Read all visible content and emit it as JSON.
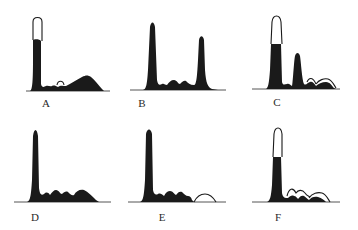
{
  "figure": {
    "panels": [
      {
        "id": "A",
        "label": "A",
        "label_pos": [
          46,
          97
        ],
        "baseline": {
          "x1": 26,
          "x2": 110,
          "y": 91
        },
        "fill": "M30,91 C32,90 33,85 33,60 L33,40 C34,39 40,39 41,41 L41,84 C42,88 44,87 46,86 C48,85 50,87 52,86 C54,85 56,86 58,87 C60,85 64,86 66,86 C70,84 76,80 82,77 C86,75 88,75 91,77 C95,80 99,86 102,89 L104,91 Z",
        "outlines": [
          "M33,40 L33,22 C33,16 42,16 42,22 L42,41",
          "M57,85 C58,80 63,80 64,85"
        ]
      },
      {
        "id": "B",
        "label": "B",
        "label_pos": [
          142,
          97
        ],
        "baseline": {
          "x1": 130,
          "x2": 226,
          "y": 90
        },
        "fill": "M143,90 C146,89 147,86 148,70 L150,27 C151,21 154,21 155,27 L157,80 C158,86 160,85 162,84 C164,83 165,85 167,85 C169,82 171,80 174,80 C177,80 178,84 180,84 C182,82 184,80 186,81 C188,83 190,85 194,85 C196,85 197,80 198,60 L199,40 C200,35 203,35 204,40 L205,70 C206,84 208,87 212,89 L218,90 Z",
        "outlines": []
      },
      {
        "id": "C",
        "label": "C",
        "label_pos": [
          277,
          96
        ],
        "baseline": {
          "x1": 252,
          "x2": 340,
          "y": 89
        },
        "fill": "M266,89 C268,88 269,84 270,70 L271,44 L281,44 L282,82 C283,86 285,84 287,84 C289,83 290,85 292,86 C293,80 294,60 295,56 C296,52 299,52 300,56 C301,62 302,80 304,84 C306,86 308,82 310,82 C312,81 314,83 316,86 C318,84 322,82 326,82 C330,82 332,86 334,88 L336,89 Z",
        "outlines": [
          "M271,44 L272,22 C273,14 280,14 281,22 L282,44",
          "M307,82 C309,77 313,77 316,84",
          "M316,84 C319,80 324,78 328,79 C332,80 334,85 336,88"
        ]
      },
      {
        "id": "D",
        "label": "D",
        "label_pos": [
          35,
          211
        ],
        "baseline": {
          "x1": 14,
          "x2": 111,
          "y": 202
        },
        "fill": "M27,202 C30,201 31,197 32,180 L33,136 C34,128 37,128 38,136 L39,188 C40,196 42,195 44,194 C46,192 48,192 50,195 C52,192 54,190 56,190 C59,190 60,194 62,194 C64,192 66,191 68,192 C70,194 72,196 74,195 C76,191 80,189 84,190 C88,192 92,196 96,200 L99,202 Z",
        "outlines": []
      },
      {
        "id": "E",
        "label": "E",
        "label_pos": [
          162,
          211
        ],
        "baseline": {
          "x1": 128,
          "x2": 226,
          "y": 202
        },
        "fill": "M140,202 C143,201 144,197 145,180 L146,134 C147,128 151,128 152,134 L153,190 C154,195 156,195 158,194 C160,193 162,194 164,196 C166,192 168,191 170,191 C173,191 174,194 176,195 C178,192 180,191 182,192 C184,194 186,196 188,196 C190,196 191,197 192,200 L194,202 Z",
        "outlines": [
          "M194,202 C197,196 201,194 205,194 C209,194 213,197 216,202"
        ]
      },
      {
        "id": "F",
        "label": "F",
        "label_pos": [
          278,
          211
        ],
        "baseline": {
          "x1": 252,
          "x2": 340,
          "y": 202
        },
        "fill": "M267,202 C270,201 271,197 272,185 L273,157 L281,157 L282,193 C283,198 285,198 288,198 C290,196 292,195 294,196 C296,196 297,198 298,199 C300,196 302,195 304,196 C306,197 307,199 309,200 C311,197 315,196 318,197 C322,198 324,200 326,202 Z",
        "outlines": [
          "M273,157 L274,134 C275,126 281,126 282,134 L282,157",
          "M287,196 C289,188 293,187 296,193 C298,190 302,189 305,193 C307,196 309,196 310,197",
          "M309,198 C312,193 318,192 322,193 C326,194 328,199 330,202"
        ]
      }
    ]
  },
  "colors": {
    "ink": "#1a1a1a",
    "baseline": "#555555",
    "label": "#2a2a2a",
    "background": "#ffffff"
  }
}
